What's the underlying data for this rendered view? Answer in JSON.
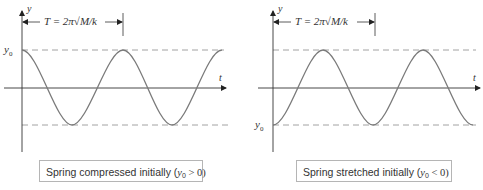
{
  "diagram": {
    "panels": [
      {
        "id": "compressed",
        "y_axis_label": "y",
        "t_axis_label": "t",
        "period_label": "T = 2π√M/k",
        "y0_label": "y0",
        "y0_position": "top",
        "caption": {
          "text": "Spring compressed initially (",
          "var": "y",
          "sub": "0",
          "rel": " > 0)"
        },
        "curve": "cosine",
        "start": "max"
      },
      {
        "id": "stretched",
        "y_axis_label": "y",
        "t_axis_label": "t",
        "period_label": "T = 2π√M/k",
        "y0_label": "y0",
        "y0_position": "bottom",
        "caption": {
          "text": "Spring stretched initially (",
          "var": "y",
          "sub": "0",
          "rel": " < 0)"
        },
        "curve": "negative-cosine",
        "start": "min"
      }
    ],
    "colors": {
      "curve": "#7a7a7a",
      "axis": "#333333",
      "dashed": "#8a8a8a",
      "caption_border": "#b5b5b5"
    }
  }
}
